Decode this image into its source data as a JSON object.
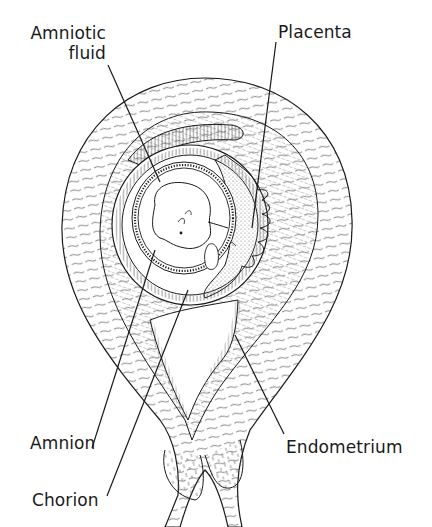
{
  "diagram": {
    "labels": {
      "amniotic_fluid_line1": "Amniotic",
      "amniotic_fluid_line2": "fluid",
      "placenta": "Placenta",
      "amnion": "Amnion",
      "chorion": "Chorion",
      "endometrium": "Endometrium"
    }
  },
  "colors": {
    "ink": "#1a1a1a",
    "background": "#ffffff",
    "placenta_stipple": "#8a8a8a"
  }
}
